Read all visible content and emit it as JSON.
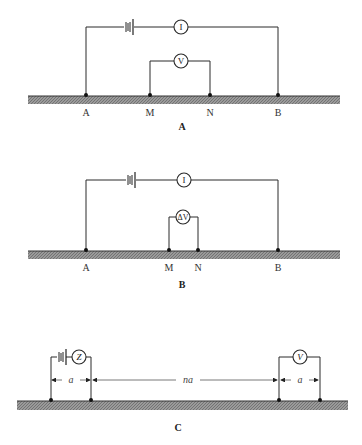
{
  "figure": {
    "panels": [
      {
        "id": "A",
        "caption": "A",
        "electrodes": [
          {
            "label": "A"
          },
          {
            "label": "M"
          },
          {
            "label": "N"
          },
          {
            "label": "B"
          }
        ],
        "current_meter": "I",
        "potential_meter": "V"
      },
      {
        "id": "B",
        "caption": "B",
        "electrodes": [
          {
            "label": "A"
          },
          {
            "label": "M"
          },
          {
            "label": "N"
          },
          {
            "label": "B"
          }
        ],
        "current_meter": "I",
        "potential_meter": "ΔV"
      },
      {
        "id": "C",
        "caption": "C",
        "current_meter": "Z",
        "potential_meter": "V",
        "dimensions": {
          "left_spacing": "a",
          "middle_spacing": "na",
          "right_spacing": "a"
        }
      }
    ]
  },
  "colors": {
    "ground": "#8a8a8a",
    "wire": "#2a2a2a"
  }
}
